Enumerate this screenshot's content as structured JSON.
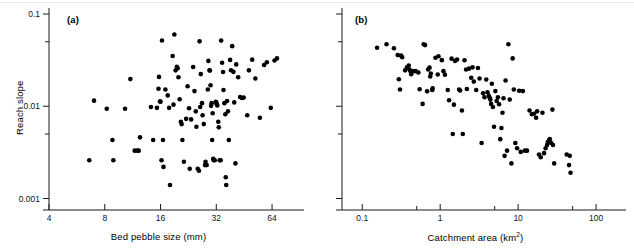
{
  "figure": {
    "panels": [
      {
        "tag": "(a)",
        "xlabel": "Bed pebble size (mm)",
        "ylabel": "Reach slope"
      },
      {
        "tag": "(b)",
        "xlabel_main": "Catchment area (km",
        "xlabel_sup": "2",
        "xlabel_tail": ")",
        "ylabel": ""
      }
    ]
  },
  "chart_data": [
    {
      "type": "scatter",
      "title": "(a)",
      "xlabel": "Bed pebble size (mm)",
      "ylabel": "Reach slope",
      "xscale": "log",
      "yscale": "log",
      "xlim": [
        4,
        80
      ],
      "ylim": [
        0.00075,
        0.1
      ],
      "xticks": [
        4,
        8,
        16,
        32,
        64
      ],
      "xticklabels": [
        "4",
        "8",
        "16",
        "32",
        "64"
      ],
      "yticks": [
        0.001,
        0.01,
        0.1
      ],
      "yticklabels": [
        "0.001",
        "0.01",
        "0.1"
      ],
      "yminorticks": [
        0.005,
        0.05
      ],
      "grid": false,
      "legend": null,
      "marker": "circle",
      "marker_color": "#000000",
      "n_points": 110,
      "points": [
        [
          6.6,
          0.0026
        ],
        [
          7.0,
          0.0115
        ],
        [
          8.2,
          0.0094
        ],
        [
          8.8,
          0.0043
        ],
        [
          8.9,
          0.0026
        ],
        [
          10.3,
          0.0094
        ],
        [
          11.0,
          0.0197
        ],
        [
          11.6,
          0.0033
        ],
        [
          12.0,
          0.0033
        ],
        [
          12.2,
          0.0033
        ],
        [
          12.4,
          0.0046
        ],
        [
          14.2,
          0.0098
        ],
        [
          14.6,
          0.0043
        ],
        [
          15.3,
          0.0096
        ],
        [
          15.6,
          0.0155
        ],
        [
          15.7,
          0.0208
        ],
        [
          15.9,
          0.0113
        ],
        [
          16.0,
          0.0112
        ],
        [
          16.2,
          0.0026
        ],
        [
          16.3,
          0.0516
        ],
        [
          16.5,
          0.0043
        ],
        [
          16.6,
          0.0022
        ],
        [
          17.0,
          0.0152
        ],
        [
          17.5,
          0.0131
        ],
        [
          17.8,
          0.0096
        ],
        [
          18.0,
          0.0014
        ],
        [
          18.6,
          0.035
        ],
        [
          18.8,
          0.0104
        ],
        [
          19.0,
          0.06
        ],
        [
          19.3,
          0.0245
        ],
        [
          19.6,
          0.0268
        ],
        [
          19.8,
          0.0258
        ],
        [
          20.0,
          0.0206
        ],
        [
          20.3,
          0.0119
        ],
        [
          20.6,
          0.0068
        ],
        [
          20.8,
          0.0064
        ],
        [
          21.0,
          0.0043
        ],
        [
          21.4,
          0.0025
        ],
        [
          22.0,
          0.0073
        ],
        [
          22.4,
          0.0165
        ],
        [
          22.8,
          0.0095
        ],
        [
          23.0,
          0.0021
        ],
        [
          23.4,
          0.0072
        ],
        [
          24.0,
          0.0266
        ],
        [
          24.4,
          0.0146
        ],
        [
          24.8,
          0.0088
        ],
        [
          25.0,
          0.006
        ],
        [
          25.4,
          0.0021
        ],
        [
          25.8,
          0.002
        ],
        [
          26.0,
          0.0505
        ],
        [
          26.4,
          0.0223
        ],
        [
          26.8,
          0.0108
        ],
        [
          27.0,
          0.008
        ],
        [
          27.4,
          0.0064
        ],
        [
          27.8,
          0.0023
        ],
        [
          28.0,
          0.0025
        ],
        [
          28.4,
          0.0023
        ],
        [
          28.8,
          0.0152
        ],
        [
          29.0,
          0.031
        ],
        [
          29.4,
          0.0245
        ],
        [
          29.6,
          0.0244
        ],
        [
          29.8,
          0.0169
        ],
        [
          30.0,
          0.0101
        ],
        [
          30.2,
          0.0108
        ],
        [
          30.4,
          0.0043
        ],
        [
          30.8,
          0.0027
        ],
        [
          31.0,
          0.0026
        ],
        [
          31.4,
          0.0026
        ],
        [
          31.8,
          0.0112
        ],
        [
          32.0,
          0.011
        ],
        [
          32.2,
          0.0105
        ],
        [
          32.4,
          0.0102
        ],
        [
          32.8,
          0.0068
        ],
        [
          33.0,
          0.0059
        ],
        [
          33.4,
          0.0026
        ],
        [
          33.8,
          0.0026
        ],
        [
          34.0,
          0.0515
        ],
        [
          34.4,
          0.0296
        ],
        [
          34.8,
          0.0235
        ],
        [
          35.0,
          0.015
        ],
        [
          35.4,
          0.0108
        ],
        [
          35.8,
          0.0082
        ],
        [
          36.0,
          0.0017
        ],
        [
          36.2,
          0.0014
        ],
        [
          36.6,
          0.0114
        ],
        [
          37.0,
          0.0088
        ],
        [
          37.4,
          0.0043
        ],
        [
          38.0,
          0.0318
        ],
        [
          38.4,
          0.0246
        ],
        [
          39.0,
          0.0448
        ],
        [
          39.6,
          0.0236
        ],
        [
          40.0,
          0.011
        ],
        [
          40.6,
          0.0024
        ],
        [
          41.0,
          0.0284
        ],
        [
          42.0,
          0.0206
        ],
        [
          43.0,
          0.0126
        ],
        [
          44.0,
          0.0123
        ],
        [
          45.0,
          0.0124
        ],
        [
          47.0,
          0.008
        ],
        [
          48.0,
          0.0245
        ],
        [
          50.0,
          0.032
        ],
        [
          52.0,
          0.02
        ],
        [
          55.0,
          0.0075
        ],
        [
          58.0,
          0.028
        ],
        [
          60.0,
          0.03
        ],
        [
          63.0,
          0.0096
        ],
        [
          66.0,
          0.0313
        ],
        [
          68.0,
          0.033
        ],
        [
          30.6,
          0.0084
        ],
        [
          26.2,
          0.0098
        ]
      ]
    },
    {
      "type": "scatter",
      "title": "(b)",
      "xlabel": "Catchment area (km2)",
      "ylabel": "Reach slope",
      "xscale": "log",
      "yscale": "log",
      "xlim": [
        0.055,
        160
      ],
      "ylim": [
        0.00075,
        0.1
      ],
      "xticks": [
        0.1,
        1,
        10,
        100
      ],
      "xticklabels": [
        "0.1",
        "1",
        "10",
        "100"
      ],
      "xminorticks": [
        0.5,
        5,
        50
      ],
      "yticks": [
        0.001,
        0.01,
        0.1
      ],
      "yticklabels": [],
      "yminorticks": [
        0.005,
        0.05
      ],
      "grid": false,
      "legend": null,
      "marker": "circle",
      "marker_color": "#000000",
      "n_points": 110,
      "points": [
        [
          0.155,
          0.043
        ],
        [
          0.205,
          0.047
        ],
        [
          0.255,
          0.0425
        ],
        [
          0.285,
          0.036
        ],
        [
          0.315,
          0.0355
        ],
        [
          0.325,
          0.034
        ],
        [
          0.355,
          0.0245
        ],
        [
          0.375,
          0.0265
        ],
        [
          0.395,
          0.0276
        ],
        [
          0.405,
          0.025
        ],
        [
          0.415,
          0.024
        ],
        [
          0.425,
          0.0222
        ],
        [
          0.295,
          0.0196
        ],
        [
          0.305,
          0.0152
        ],
        [
          0.455,
          0.024
        ],
        [
          0.485,
          0.024
        ],
        [
          0.525,
          0.0232
        ],
        [
          0.545,
          0.0153
        ],
        [
          0.595,
          0.0106
        ],
        [
          0.615,
          0.047
        ],
        [
          0.64,
          0.046
        ],
        [
          0.68,
          0.0145
        ],
        [
          0.7,
          0.025
        ],
        [
          0.73,
          0.0262
        ],
        [
          0.745,
          0.021
        ],
        [
          0.76,
          0.0226
        ],
        [
          0.79,
          0.015
        ],
        [
          0.8,
          0.0156
        ],
        [
          0.87,
          0.0335
        ],
        [
          0.93,
          0.0221
        ],
        [
          0.95,
          0.0348
        ],
        [
          1.05,
          0.0316
        ],
        [
          1.1,
          0.024
        ],
        [
          1.15,
          0.022
        ],
        [
          1.25,
          0.015
        ],
        [
          1.3,
          0.0116
        ],
        [
          1.4,
          0.0328
        ],
        [
          1.45,
          0.005
        ],
        [
          1.5,
          0.0104
        ],
        [
          1.55,
          0.031
        ],
        [
          1.65,
          0.0321
        ],
        [
          1.75,
          0.0152
        ],
        [
          1.8,
          0.0148
        ],
        [
          1.9,
          0.009
        ],
        [
          1.95,
          0.005
        ],
        [
          2.05,
          0.0315
        ],
        [
          2.15,
          0.025
        ],
        [
          2.2,
          0.0154
        ],
        [
          2.35,
          0.0256
        ],
        [
          2.5,
          0.0204
        ],
        [
          2.6,
          0.0264
        ],
        [
          2.7,
          0.0185
        ],
        [
          2.9,
          0.015
        ],
        [
          3.05,
          0.026
        ],
        [
          3.2,
          0.02
        ],
        [
          3.4,
          0.004
        ],
        [
          3.55,
          0.0138
        ],
        [
          3.7,
          0.0125
        ],
        [
          3.9,
          0.0195
        ],
        [
          4.05,
          0.0142
        ],
        [
          4.2,
          0.013
        ],
        [
          4.3,
          0.0124
        ],
        [
          4.4,
          0.0118
        ],
        [
          4.5,
          0.0106
        ],
        [
          4.6,
          0.0175
        ],
        [
          4.75,
          0.0098
        ],
        [
          4.9,
          0.006
        ],
        [
          5.1,
          0.0146
        ],
        [
          5.3,
          0.0114
        ],
        [
          5.5,
          0.0125
        ],
        [
          5.7,
          0.0105
        ],
        [
          5.9,
          0.0044
        ],
        [
          6.1,
          0.0058
        ],
        [
          6.3,
          0.0085
        ],
        [
          6.5,
          0.0122
        ],
        [
          6.7,
          0.0029
        ],
        [
          6.9,
          0.019
        ],
        [
          7.2,
          0.0033
        ],
        [
          7.5,
          0.047
        ],
        [
          7.8,
          0.0118
        ],
        [
          8.2,
          0.0024
        ],
        [
          8.5,
          0.033
        ],
        [
          8.8,
          0.0152
        ],
        [
          9.2,
          0.004
        ],
        [
          9.7,
          0.0035
        ],
        [
          10.3,
          0.0147
        ],
        [
          10.8,
          0.0032
        ],
        [
          11.5,
          0.0146
        ],
        [
          12.2,
          0.0033
        ],
        [
          13.0,
          0.0033
        ],
        [
          14.0,
          0.009
        ],
        [
          15.0,
          0.0082
        ],
        [
          16.0,
          0.0083
        ],
        [
          17.0,
          0.0075
        ],
        [
          17.5,
          0.0088
        ],
        [
          18.5,
          0.003
        ],
        [
          19.5,
          0.0028
        ],
        [
          20.5,
          0.0085
        ],
        [
          21.5,
          0.0031
        ],
        [
          22.5,
          0.0035
        ],
        [
          23.5,
          0.0038
        ],
        [
          24.0,
          0.0041
        ],
        [
          25.0,
          0.0043
        ],
        [
          25.5,
          0.0044
        ],
        [
          26.5,
          0.004
        ],
        [
          27.5,
          0.0092
        ],
        [
          28.0,
          0.0038
        ],
        [
          29.0,
          0.0024
        ],
        [
          42.0,
          0.003
        ],
        [
          45.0,
          0.0023
        ],
        [
          46.0,
          0.0029
        ],
        [
          47.0,
          0.0019
        ]
      ]
    }
  ]
}
